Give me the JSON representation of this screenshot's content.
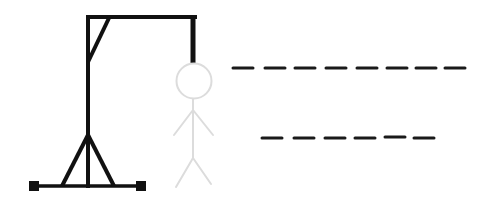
{
  "game": {
    "title": "Hangman",
    "gallows_color": "#111111",
    "figure_color": "#dcdcdc",
    "blank_color": "#1a1a1a",
    "background": "#ffffff"
  },
  "word": {
    "rows": [
      {
        "letters": [
          "",
          "",
          "",
          "",
          "",
          "",
          "",
          ""
        ],
        "length": 8,
        "y": 68,
        "x": [
          232,
          264,
          294,
          325,
          356,
          386,
          416,
          444
        ]
      },
      {
        "letters": [
          "",
          "",
          "",
          "",
          "",
          ""
        ],
        "length": 6,
        "y": 138,
        "x": [
          261,
          293,
          324,
          354,
          384,
          413
        ]
      }
    ],
    "dash_width": 22
  },
  "figure": {
    "parts": [
      "head",
      "body",
      "left-arm",
      "right-arm",
      "left-leg",
      "right-leg"
    ]
  }
}
